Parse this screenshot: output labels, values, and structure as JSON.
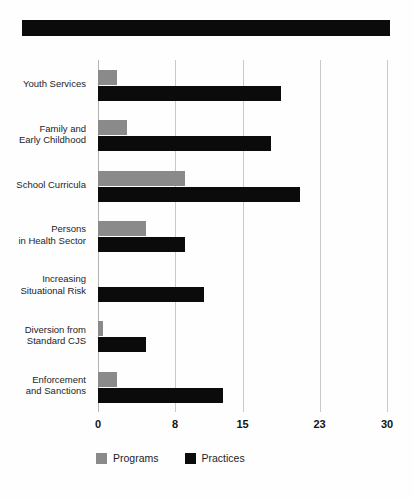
{
  "banner": {
    "name": "title-banner",
    "text": "",
    "color": "#0b0b0b"
  },
  "chart_data": {
    "type": "bar",
    "orientation": "horizontal",
    "title": "",
    "xlabel": "",
    "ylabel": "",
    "xlim": [
      0,
      30
    ],
    "xticks": [
      0,
      8,
      15,
      23,
      30
    ],
    "xtick_labels": [
      "0",
      "8",
      "15",
      "23",
      "30"
    ],
    "grid": true,
    "grid_axis": "x",
    "legend_position": "bottom-left",
    "categories": [
      "Youth Services",
      "Family and\nEarly Childhood",
      "School Curricula",
      "Persons\nin Health Sector",
      "Increasing\nSituational Risk",
      "Diversion from\nStandard CJS",
      "Enforcement\nand Sanctions"
    ],
    "series": [
      {
        "name": "Programs",
        "color": "#8a8a8a",
        "values": [
          2,
          3,
          9,
          5,
          0,
          0.5,
          2
        ]
      },
      {
        "name": "Practices",
        "color": "#0b0b0b",
        "values": [
          19,
          18,
          21,
          9,
          11,
          5,
          13
        ]
      }
    ]
  },
  "legend": {
    "items": [
      {
        "label": "Programs",
        "swatch": "programs"
      },
      {
        "label": "Practices",
        "swatch": "practices"
      }
    ]
  }
}
